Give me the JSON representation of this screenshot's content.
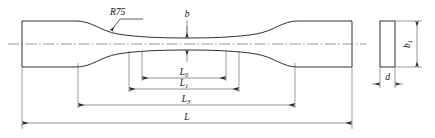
{
  "drawing": {
    "title": "Flat tensile test specimen",
    "view_front_name": "front-view",
    "view_section_name": "cross-section-view",
    "stroke_color": "#1a1a1a",
    "dimension_color": "#3a3a3a",
    "centerline_color": "#555555",
    "background_color": "#ffffff"
  },
  "labels": {
    "radius": {
      "text": "R75",
      "base": "R",
      "value": "75"
    },
    "width_gauge": {
      "base": "b",
      "sub": ""
    },
    "width_grip": {
      "base": "b",
      "sub": "1"
    },
    "thickness": {
      "base": "d",
      "sub": ""
    },
    "gauge_length": {
      "base": "L",
      "sub": "0"
    },
    "extension_length": {
      "base": "L",
      "sub": "1"
    },
    "parallel_length": {
      "base": "L",
      "sub": "3"
    },
    "total_length": {
      "base": "L",
      "sub": ""
    }
  },
  "dimensions": [
    {
      "name": "L0",
      "base": "L",
      "sub": "0",
      "x1": 142,
      "x2": 226,
      "y": 78
    },
    {
      "name": "L1",
      "base": "L",
      "sub": "1",
      "x1": 129,
      "x2": 239,
      "y": 89
    },
    {
      "name": "L3",
      "base": "L",
      "sub": "3",
      "x1": 78,
      "x2": 295,
      "y": 105
    },
    {
      "name": "L",
      "base": "L",
      "sub": "",
      "x1": 22,
      "x2": 352,
      "y": 123
    }
  ]
}
